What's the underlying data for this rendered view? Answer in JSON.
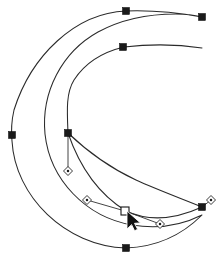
{
  "document": {
    "title": "Crescent Moon Path",
    "background_color": "#ffffff",
    "width": 223,
    "height": 266
  },
  "style": {
    "stroke_color": "#2a2a2a",
    "node_fill": "#1a1a1a",
    "selected_node_fill": "#ffffff",
    "handle_line_color": "#303030",
    "handle_knob_fill": "#ffffff",
    "cursor_color": "#111111"
  },
  "paths": [
    {
      "name": "crescent-outer-path",
      "closed": true,
      "d": "M 126 11 C 75 13 31 56 14 110 C 11 123 11 131 12 141 C 15 196 65 246 126 248 C 155 247 181 236 202 215 C 180 226 155 229 132 225 C 86 217 50 180 45 134 C 41 92 62 52 98 32 C 122 19 149 14 176 14 C 185 14 194 15 202 17 C 180 13 153 10 126 11 Z"
    },
    {
      "name": "crescent-inner-edge",
      "closed": false,
      "d": "M 202 48 C 176 44 150 44 124 47 C 103 52 85 63 74 80 C 66 93 67 110 68 133"
    },
    {
      "name": "leaf-subpath-upper",
      "closed": false,
      "d": "M 68 133 C 88 152 110 168 136 180 C 158 190 180 198 202 207"
    },
    {
      "name": "leaf-subpath-lower",
      "closed": false,
      "d": "M 68 133 C 80 168 100 195 126 211 C 152 223 178 218 202 207"
    }
  ],
  "nodes": [
    {
      "name": "node-top-outer",
      "x": 126,
      "y": 11,
      "type": "anchor",
      "selected": false
    },
    {
      "name": "node-right-outer",
      "x": 202,
      "y": 17,
      "type": "anchor",
      "selected": false
    },
    {
      "name": "node-left-outer",
      "x": 12,
      "y": 135,
      "type": "anchor",
      "selected": false
    },
    {
      "name": "node-bottom-outer",
      "x": 126,
      "y": 248,
      "type": "anchor",
      "selected": false
    },
    {
      "name": "node-top-inner",
      "x": 123,
      "y": 47,
      "type": "anchor",
      "selected": false
    },
    {
      "name": "node-leaf-left",
      "x": 68,
      "y": 133,
      "type": "anchor",
      "selected": false
    },
    {
      "name": "node-leaf-right",
      "x": 202,
      "y": 207,
      "type": "anchor",
      "selected": false
    },
    {
      "name": "node-leaf-selected",
      "x": 125,
      "y": 211,
      "type": "anchor",
      "selected": true
    }
  ],
  "handles": [
    {
      "name": "handle-leaf-left-down",
      "anchor_x": 68,
      "anchor_y": 133,
      "knob_x": 68,
      "knob_y": 171
    },
    {
      "name": "handle-selected-in",
      "anchor_x": 125,
      "anchor_y": 211,
      "knob_x": 87,
      "knob_y": 200
    },
    {
      "name": "handle-selected-out",
      "anchor_x": 125,
      "anchor_y": 211,
      "knob_x": 160,
      "knob_y": 224
    },
    {
      "name": "handle-leaf-right-out",
      "anchor_x": 202,
      "anchor_y": 207,
      "knob_x": 211,
      "knob_y": 200
    }
  ],
  "cursor": {
    "name": "arrow-pointer",
    "x": 127,
    "y": 213,
    "kind": "node-edit-arrow"
  }
}
